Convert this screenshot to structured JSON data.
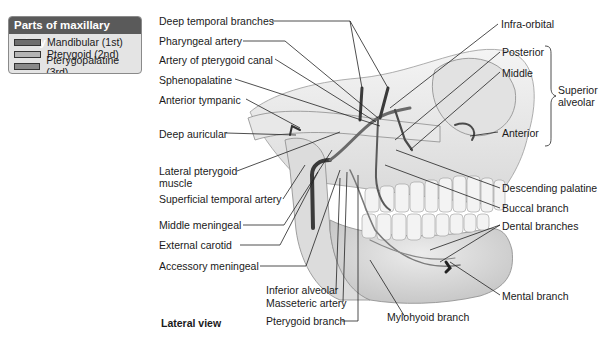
{
  "legend": {
    "title": "Parts of maxillary artery",
    "items": [
      {
        "label": "Mandibular (1st)",
        "color": "#6e6e6e"
      },
      {
        "label": "Pterygoid (2nd)",
        "color": "#b4b4b4"
      },
      {
        "label": "Pterygopalatine (3rd)",
        "color": "#8a8a8a"
      }
    ]
  },
  "labels_left": {
    "deep_temporal": "Deep temporal branches",
    "pharyngeal": "Pharyngeal artery",
    "pterygoid_canal": "Artery of pterygoid canal",
    "sphenopalatine": "Sphenopalatine",
    "anterior_tympanic": "Anterior tympanic",
    "deep_auricular": "Deep auricular",
    "lateral_pterygoid_1": "Lateral pterygoid",
    "lateral_pterygoid_2": "muscle",
    "superficial_temporal": "Superficial temporal artery",
    "middle_meningeal": "Middle meningeal",
    "external_carotid": "External carotid",
    "accessory_meningeal": "Accessory meningeal"
  },
  "labels_bottom": {
    "inferior_alveolar": "Inferior alveolar",
    "masseteric": "Masseteric artery",
    "pterygoid_branch": "Pterygoid branch",
    "mylohyoid": "Mylohyoid branch",
    "view": "Lateral view"
  },
  "labels_right": {
    "infra_orbital": "Infra-orbital",
    "posterior": "Posterior",
    "middle": "Middle",
    "superior_alveolar_1": "Superior",
    "superior_alveolar_2": "alveolar",
    "anterior": "Anterior",
    "descending_palatine": "Descending palatine",
    "buccal": "Buccal branch",
    "dental": "Dental branches",
    "mental": "Mental branch"
  }
}
